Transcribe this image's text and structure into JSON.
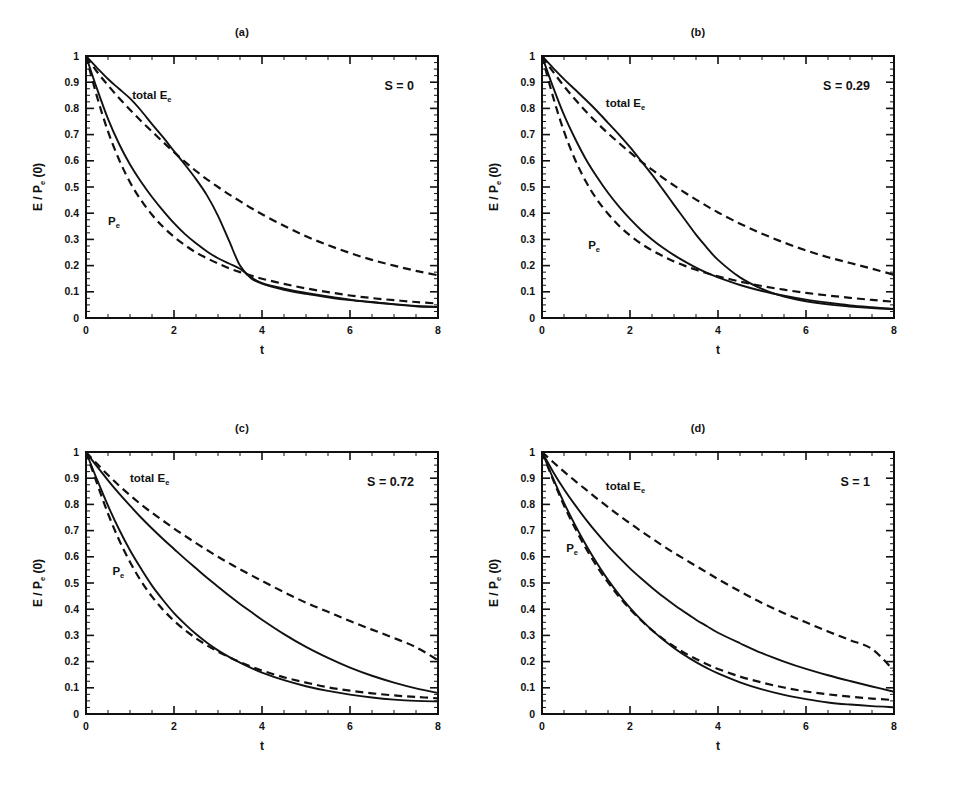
{
  "figure": {
    "background": "#ffffff",
    "ink": "#111111",
    "panel_count": 4
  },
  "axes": {
    "xlabel": "t",
    "ylabel_main": "E / P",
    "ylabel_sub": "e",
    "ylabel_tail": " (0)",
    "xlim": [
      0,
      8
    ],
    "ylim": [
      0,
      1
    ],
    "x_major_ticks": [
      0,
      2,
      4,
      6,
      8
    ],
    "x_major_labels": [
      "0",
      "2",
      "4",
      "6",
      "8"
    ],
    "x_minor_step": 0.5,
    "y_major_ticks": [
      0,
      0.1,
      0.2,
      0.3,
      0.4,
      0.5,
      0.6,
      0.7,
      0.8,
      0.9,
      1
    ],
    "y_major_labels": [
      "0",
      "0.1",
      "0.2",
      "0.3",
      "0.4",
      "0.5",
      "0.6",
      "0.7",
      "0.8",
      "0.9",
      "1"
    ],
    "y_minor_step": 0.025,
    "grid": false
  },
  "curve_labels": {
    "total": "total E",
    "total_sub": "e",
    "pe": "P",
    "pe_sub": "e"
  },
  "chart_data": [
    {
      "type": "line",
      "id": "panel-a",
      "title": "(a)",
      "annotation": "S = 0",
      "S": 0,
      "xlabel": "t",
      "ylabel": "E / Pe (0)",
      "xlim": [
        0,
        8
      ],
      "ylim": [
        0,
        1
      ],
      "grid": false,
      "legend": "inline-labels",
      "label_positions": {
        "total": {
          "x": 1.05,
          "y": 0.835
        },
        "pe": {
          "x": 0.5,
          "y": 0.355
        }
      },
      "x": [
        0,
        0.25,
        0.5,
        0.75,
        1,
        1.25,
        1.5,
        1.75,
        2,
        2.25,
        2.5,
        2.75,
        3,
        3.25,
        3.5,
        3.75,
        4,
        4.5,
        5,
        5.5,
        6,
        6.5,
        7,
        7.5,
        8
      ],
      "series": [
        {
          "name": "total Ee (solid)",
          "style": "solid",
          "values": [
            1.0,
            0.955,
            0.912,
            0.875,
            0.838,
            0.792,
            0.74,
            0.69,
            0.637,
            0.585,
            0.53,
            0.468,
            0.39,
            0.295,
            0.2,
            0.152,
            0.131,
            0.108,
            0.092,
            0.079,
            0.068,
            0.06,
            0.052,
            0.045,
            0.042
          ]
        },
        {
          "name": "total Ee (dashed)",
          "style": "dashed",
          "values": [
            1.0,
            0.94,
            0.888,
            0.84,
            0.795,
            0.752,
            0.712,
            0.672,
            0.633,
            0.596,
            0.561,
            0.529,
            0.5,
            0.472,
            0.446,
            0.42,
            0.396,
            0.352,
            0.312,
            0.278,
            0.248,
            0.222,
            0.2,
            0.18,
            0.163
          ]
        },
        {
          "name": "Pe (solid)",
          "style": "solid",
          "values": [
            1.0,
            0.875,
            0.76,
            0.665,
            0.586,
            0.52,
            0.462,
            0.41,
            0.362,
            0.32,
            0.285,
            0.254,
            0.228,
            0.208,
            0.188,
            0.156,
            0.133,
            0.112,
            0.096,
            0.082,
            0.07,
            0.061,
            0.053,
            0.046,
            0.042
          ]
        },
        {
          "name": "Pe (dashed)",
          "style": "dashed",
          "values": [
            1.0,
            0.845,
            0.712,
            0.605,
            0.518,
            0.45,
            0.394,
            0.348,
            0.31,
            0.278,
            0.25,
            0.228,
            0.208,
            0.19,
            0.175,
            0.162,
            0.15,
            0.13,
            0.113,
            0.099,
            0.086,
            0.076,
            0.068,
            0.061,
            0.055
          ]
        }
      ]
    },
    {
      "type": "line",
      "id": "panel-b",
      "title": "(b)",
      "annotation": "S = 0.29",
      "S": 0.29,
      "xlabel": "t",
      "ylabel": "E / Pe (0)",
      "xlim": [
        0,
        8
      ],
      "ylim": [
        0,
        1
      ],
      "grid": false,
      "legend": "inline-labels",
      "label_positions": {
        "total": {
          "x": 1.45,
          "y": 0.805
        },
        "pe": {
          "x": 1.05,
          "y": 0.265
        }
      },
      "x": [
        0,
        0.25,
        0.5,
        0.75,
        1,
        1.25,
        1.5,
        1.75,
        2,
        2.25,
        2.5,
        2.75,
        3,
        3.25,
        3.5,
        3.75,
        4,
        4.5,
        5,
        5.5,
        6,
        6.5,
        7,
        7.5,
        8
      ],
      "series": [
        {
          "name": "total Ee (solid)",
          "style": "solid",
          "values": [
            1.0,
            0.955,
            0.912,
            0.872,
            0.832,
            0.79,
            0.745,
            0.7,
            0.652,
            0.6,
            0.547,
            0.49,
            0.432,
            0.375,
            0.318,
            0.268,
            0.222,
            0.155,
            0.111,
            0.082,
            0.064,
            0.052,
            0.044,
            0.038,
            0.034
          ]
        },
        {
          "name": "total Ee (dashed)",
          "style": "dashed",
          "values": [
            1.0,
            0.94,
            0.885,
            0.835,
            0.788,
            0.745,
            0.705,
            0.668,
            0.632,
            0.598,
            0.566,
            0.535,
            0.506,
            0.478,
            0.452,
            0.427,
            0.403,
            0.36,
            0.322,
            0.288,
            0.258,
            0.232,
            0.21,
            0.188,
            0.165
          ]
        },
        {
          "name": "Pe (solid)",
          "style": "solid",
          "values": [
            1.0,
            0.882,
            0.775,
            0.685,
            0.605,
            0.538,
            0.478,
            0.425,
            0.378,
            0.336,
            0.3,
            0.268,
            0.24,
            0.215,
            0.192,
            0.172,
            0.155,
            0.126,
            0.103,
            0.085,
            0.07,
            0.058,
            0.048,
            0.041,
            0.035
          ]
        },
        {
          "name": "Pe (dashed)",
          "style": "dashed",
          "values": [
            1.0,
            0.845,
            0.712,
            0.605,
            0.52,
            0.452,
            0.398,
            0.352,
            0.315,
            0.284,
            0.258,
            0.236,
            0.216,
            0.199,
            0.184,
            0.171,
            0.159,
            0.139,
            0.122,
            0.108,
            0.096,
            0.086,
            0.077,
            0.069,
            0.062
          ]
        }
      ]
    },
    {
      "type": "line",
      "id": "panel-c",
      "title": "(c)",
      "annotation": "S = 0.72",
      "S": 0.72,
      "xlabel": "t",
      "ylabel": "E / Pe (0)",
      "xlim": [
        0,
        8
      ],
      "ylim": [
        0,
        1
      ],
      "grid": false,
      "legend": "inline-labels",
      "label_positions": {
        "total": {
          "x": 1.0,
          "y": 0.885
        },
        "pe": {
          "x": 0.6,
          "y": 0.53
        }
      },
      "x": [
        0,
        0.25,
        0.5,
        0.75,
        1,
        1.25,
        1.5,
        1.75,
        2,
        2.25,
        2.5,
        2.75,
        3,
        3.25,
        3.5,
        3.75,
        4,
        4.5,
        5,
        5.5,
        6,
        6.5,
        7,
        7.5,
        8
      ],
      "series": [
        {
          "name": "total Ee (solid)",
          "style": "solid",
          "values": [
            1.0,
            0.945,
            0.892,
            0.842,
            0.795,
            0.75,
            0.708,
            0.668,
            0.63,
            0.592,
            0.556,
            0.52,
            0.486,
            0.452,
            0.42,
            0.39,
            0.36,
            0.305,
            0.256,
            0.214,
            0.177,
            0.146,
            0.12,
            0.098,
            0.08
          ]
        },
        {
          "name": "total Ee (dashed)",
          "style": "dashed",
          "values": [
            1.0,
            0.955,
            0.912,
            0.872,
            0.835,
            0.8,
            0.768,
            0.738,
            0.708,
            0.68,
            0.652,
            0.626,
            0.6,
            0.576,
            0.552,
            0.53,
            0.508,
            0.465,
            0.425,
            0.39,
            0.355,
            0.322,
            0.29,
            0.255,
            0.205
          ]
        },
        {
          "name": "Pe (solid)",
          "style": "solid",
          "values": [
            1.0,
            0.895,
            0.795,
            0.705,
            0.625,
            0.555,
            0.49,
            0.435,
            0.385,
            0.343,
            0.305,
            0.272,
            0.243,
            0.218,
            0.196,
            0.176,
            0.158,
            0.129,
            0.106,
            0.088,
            0.074,
            0.063,
            0.055,
            0.05,
            0.048
          ]
        },
        {
          "name": "Pe (dashed)",
          "style": "dashed",
          "values": [
            1.0,
            0.88,
            0.765,
            0.665,
            0.58,
            0.508,
            0.448,
            0.398,
            0.356,
            0.32,
            0.289,
            0.262,
            0.238,
            0.217,
            0.198,
            0.181,
            0.166,
            0.14,
            0.12,
            0.102,
            0.089,
            0.079,
            0.071,
            0.065,
            0.06
          ]
        }
      ]
    },
    {
      "type": "line",
      "id": "panel-d",
      "title": "(d)",
      "annotation": "S = 1",
      "S": 1,
      "xlabel": "t",
      "ylabel": "E / Pe (0)",
      "xlim": [
        0,
        8
      ],
      "ylim": [
        0,
        1
      ],
      "grid": false,
      "legend": "inline-labels",
      "label_positions": {
        "total": {
          "x": 1.45,
          "y": 0.855
        },
        "pe": {
          "x": 0.55,
          "y": 0.62
        }
      },
      "x": [
        0,
        0.25,
        0.5,
        0.75,
        1,
        1.25,
        1.5,
        1.75,
        2,
        2.25,
        2.5,
        2.75,
        3,
        3.25,
        3.5,
        3.75,
        4,
        4.5,
        5,
        5.5,
        6,
        6.5,
        7,
        7.5,
        8
      ],
      "series": [
        {
          "name": "total Ee (solid)",
          "style": "solid",
          "values": [
            1.0,
            0.925,
            0.858,
            0.798,
            0.742,
            0.69,
            0.642,
            0.598,
            0.556,
            0.518,
            0.482,
            0.448,
            0.417,
            0.388,
            0.36,
            0.335,
            0.31,
            0.27,
            0.232,
            0.2,
            0.172,
            0.148,
            0.126,
            0.105,
            0.085
          ]
        },
        {
          "name": "total Ee (dashed)",
          "style": "dashed",
          "values": [
            1.0,
            0.962,
            0.925,
            0.89,
            0.856,
            0.822,
            0.79,
            0.758,
            0.728,
            0.698,
            0.67,
            0.642,
            0.615,
            0.59,
            0.565,
            0.54,
            0.515,
            0.468,
            0.424,
            0.385,
            0.35,
            0.315,
            0.282,
            0.248,
            0.165
          ]
        },
        {
          "name": "Pe (solid)",
          "style": "solid",
          "values": [
            1.0,
            0.9,
            0.806,
            0.722,
            0.645,
            0.575,
            0.512,
            0.456,
            0.405,
            0.36,
            0.32,
            0.284,
            0.252,
            0.223,
            0.198,
            0.175,
            0.155,
            0.121,
            0.094,
            0.073,
            0.057,
            0.044,
            0.036,
            0.03,
            0.026
          ]
        },
        {
          "name": "Pe (dashed)",
          "style": "dashed",
          "values": [
            1.0,
            0.895,
            0.796,
            0.71,
            0.632,
            0.563,
            0.502,
            0.448,
            0.4,
            0.358,
            0.32,
            0.287,
            0.258,
            0.232,
            0.21,
            0.19,
            0.172,
            0.143,
            0.12,
            0.101,
            0.086,
            0.075,
            0.066,
            0.059,
            0.053
          ]
        }
      ]
    }
  ]
}
